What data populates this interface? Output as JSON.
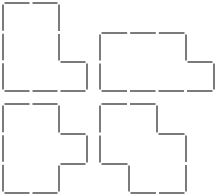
{
  "diagram": {
    "title": "",
    "stroke_color": "#5a5a5a",
    "background": "#ffffff",
    "grid_unit_px": 29,
    "shapes": [
      {
        "id": "shape-top-left",
        "description": "L-shape",
        "points": [
          [
            3,
            3
          ],
          [
            59,
            3
          ],
          [
            59,
            62
          ],
          [
            87,
            62
          ],
          [
            87,
            91
          ],
          [
            3,
            91
          ]
        ]
      },
      {
        "id": "shape-top-right",
        "description": "L-shape (horizontal)",
        "points": [
          [
            100,
            33
          ],
          [
            186,
            33
          ],
          [
            186,
            62
          ],
          [
            214,
            62
          ],
          [
            214,
            91
          ],
          [
            100,
            91
          ]
        ]
      },
      {
        "id": "shape-bottom-left",
        "description": "T-like shape with right bump",
        "points": [
          [
            3,
            104
          ],
          [
            59,
            104
          ],
          [
            59,
            134
          ],
          [
            87,
            134
          ],
          [
            87,
            164
          ],
          [
            59,
            164
          ],
          [
            59,
            193
          ],
          [
            3,
            193
          ]
        ]
      },
      {
        "id": "shape-bottom-right",
        "description": "S/Z-shape",
        "points": [
          [
            100,
            104
          ],
          [
            157,
            104
          ],
          [
            157,
            134
          ],
          [
            186,
            134
          ],
          [
            186,
            193
          ],
          [
            129,
            193
          ],
          [
            129,
            164
          ],
          [
            100,
            164
          ]
        ]
      }
    ]
  }
}
